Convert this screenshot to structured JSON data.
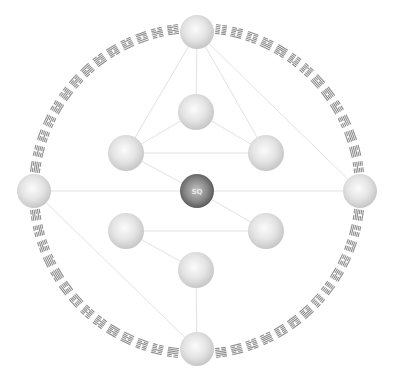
{
  "diagram": {
    "title": "",
    "center": [
      197,
      191
    ],
    "ring_radius": 162,
    "ring_hexagram_count": 64,
    "colors": {
      "background": "#ffffff",
      "connector": "#e2e2e2",
      "hexagram": "#8e8e8e",
      "sphere_light": "#f4f4f4",
      "sphere_mid": "#d6d6d6",
      "sphere_edge": "#bdbdbd",
      "sphere_dark_center": "#b8b8b8",
      "sphere_dark_edge": "#5a5a5a"
    },
    "spheres": [
      {
        "id": "top-outer",
        "x": 197,
        "y": 32,
        "r": 17,
        "style": "light",
        "label": ""
      },
      {
        "id": "left-outer",
        "x": 34,
        "y": 191,
        "r": 17,
        "style": "light",
        "label": ""
      },
      {
        "id": "right-outer",
        "x": 360,
        "y": 191,
        "r": 17,
        "style": "light",
        "label": ""
      },
      {
        "id": "bottom-outer",
        "x": 197,
        "y": 349,
        "r": 17,
        "style": "light",
        "label": ""
      },
      {
        "id": "upper-middle",
        "x": 196,
        "y": 112,
        "r": 18,
        "style": "light",
        "label": ""
      },
      {
        "id": "upper-left",
        "x": 126,
        "y": 153,
        "r": 18,
        "style": "light",
        "label": ""
      },
      {
        "id": "upper-right",
        "x": 266,
        "y": 153,
        "r": 18,
        "style": "light",
        "label": ""
      },
      {
        "id": "center",
        "x": 197,
        "y": 191,
        "r": 17,
        "style": "dark",
        "label": "SQ"
      },
      {
        "id": "lower-left",
        "x": 126,
        "y": 231,
        "r": 18,
        "style": "light",
        "label": ""
      },
      {
        "id": "lower-right",
        "x": 266,
        "y": 231,
        "r": 18,
        "style": "light",
        "label": ""
      },
      {
        "id": "bottom-inner",
        "x": 196,
        "y": 270,
        "r": 18,
        "style": "light",
        "label": ""
      }
    ],
    "connections": [
      [
        "top-outer",
        "upper-middle"
      ],
      [
        "top-outer",
        "upper-left"
      ],
      [
        "top-outer",
        "upper-right"
      ],
      [
        "top-outer",
        "right-outer"
      ],
      [
        "upper-middle",
        "upper-left"
      ],
      [
        "upper-middle",
        "upper-right"
      ],
      [
        "upper-left",
        "upper-right"
      ],
      [
        "upper-left",
        "center"
      ],
      [
        "left-outer",
        "right-outer"
      ],
      [
        "left-outer",
        "bottom-outer"
      ],
      [
        "center",
        "lower-right"
      ],
      [
        "lower-left",
        "lower-right"
      ],
      [
        "lower-left",
        "bottom-inner"
      ],
      [
        "bottom-inner",
        "bottom-outer"
      ]
    ],
    "hexagrams": [
      "111111",
      "000000",
      "100010",
      "010001",
      "111010",
      "010111",
      "010000",
      "000010",
      "111011",
      "110111",
      "111000",
      "000111",
      "101111",
      "111101",
      "001000",
      "000100",
      "100110",
      "011001",
      "110000",
      "000011",
      "100101",
      "101001",
      "000001",
      "100000",
      "100111",
      "111001",
      "100001",
      "011110",
      "010010",
      "101101",
      "001110",
      "011100",
      "001111",
      "111100",
      "000101",
      "101000",
      "101011",
      "110101",
      "001010",
      "010100",
      "110001",
      "100011",
      "111110",
      "011111",
      "000110",
      "011000",
      "010110",
      "011010",
      "101110",
      "011101",
      "100100",
      "001001",
      "001011",
      "110100",
      "101100",
      "001101",
      "011011",
      "110110",
      "010011",
      "110010",
      "110011",
      "001100",
      "101010",
      "010101"
    ]
  }
}
